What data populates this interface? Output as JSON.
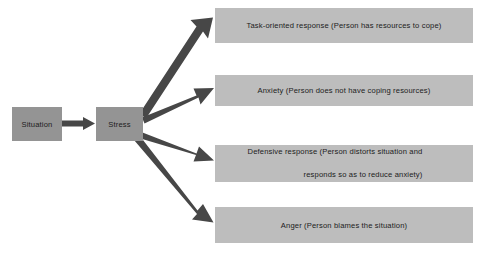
{
  "diagram": {
    "colors": {
      "source_box_fill": "#949494",
      "outcome_box_fill": "#bdbdbd",
      "arrow": "#474747",
      "text": "#1c1c1c",
      "background": "#ffffff"
    },
    "nodes": {
      "situation": {
        "label": "Situation"
      },
      "stress": {
        "label": "Stress"
      },
      "task_oriented": {
        "label": "Task-oriented response (Person has resources to cope)"
      },
      "anxiety": {
        "label": "Anxiety (Person does not have coping resources)"
      },
      "defensive": {
        "line1": "Defensive response (Person distorts situation and",
        "line2": "responds so as to reduce anxiety)"
      },
      "anger": {
        "label": "Anger (Person blames the situation)"
      }
    },
    "arrows": [
      {
        "name": "situation-to-stress",
        "from": "situation",
        "to": "stress"
      },
      {
        "name": "stress-to-task-oriented",
        "from": "stress",
        "to": "task_oriented"
      },
      {
        "name": "stress-to-anxiety",
        "from": "stress",
        "to": "anxiety"
      },
      {
        "name": "stress-to-defensive",
        "from": "stress",
        "to": "defensive"
      },
      {
        "name": "stress-to-anger",
        "from": "stress",
        "to": "anger"
      }
    ]
  }
}
